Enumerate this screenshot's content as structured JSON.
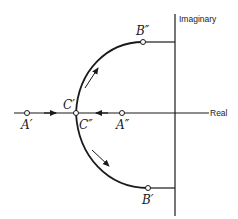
{
  "diagram": {
    "axes": {
      "real_label": "Real",
      "imaginary_label": "Imaginary"
    },
    "points": {
      "A_prime": "A′",
      "A_double_prime": "A″",
      "B_prime": "B′",
      "B_double_prime": "B″",
      "C_prime": "C′",
      "C_double_prime": "C″"
    },
    "colors": {
      "ink": "#1a1a1a",
      "background": "#ffffff"
    }
  }
}
